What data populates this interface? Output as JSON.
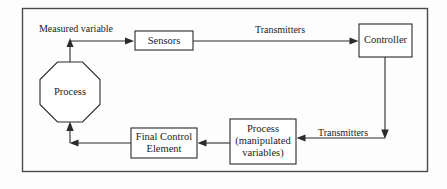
{
  "diagram": {
    "frame": {
      "present": true,
      "color": "#4a4a4a"
    },
    "background_color": "#fdfdfd",
    "line_color": "#2b2b2b",
    "nodes": [
      {
        "id": "sensors",
        "shape": "rectangle",
        "label_lines": [
          "Sensors"
        ],
        "x": 135,
        "y": 31,
        "w": 58,
        "h": 19
      },
      {
        "id": "controller",
        "shape": "rectangle",
        "label_lines": [
          "Controller"
        ],
        "x": 359,
        "y": 24,
        "w": 53,
        "h": 33
      },
      {
        "id": "process-octagon",
        "shape": "octagon",
        "label_lines": [
          "Process"
        ],
        "x": 40,
        "y": 62,
        "w": 60,
        "h": 60
      },
      {
        "id": "final-control-element",
        "shape": "rectangle",
        "label_lines": [
          "Final Control",
          "Element"
        ],
        "x": 131,
        "y": 128,
        "w": 66,
        "h": 30
      },
      {
        "id": "process-manipulated",
        "shape": "rectangle",
        "label_lines": [
          "Process",
          "(manipulated",
          "variables)"
        ],
        "x": 230,
        "y": 119,
        "w": 66,
        "h": 45
      }
    ],
    "edge_labels": [
      {
        "id": "measured-variable",
        "text": "Measured variable",
        "x": 76,
        "y": 30
      },
      {
        "id": "transmitters-top",
        "text": "Transmitters",
        "x": 280,
        "y": 31
      },
      {
        "id": "transmitters-bottom",
        "text": "Transmitters",
        "x": 343,
        "y": 134
      }
    ],
    "edges": [
      {
        "id": "process-to-sensors",
        "from": "process-octagon",
        "to": "sensors",
        "label": "Measured variable"
      },
      {
        "id": "sensors-to-controller",
        "from": "sensors",
        "to": "controller",
        "label": "Transmitters"
      },
      {
        "id": "controller-to-process-manipulated",
        "from": "controller",
        "to": "process-manipulated",
        "label": "Transmitters"
      },
      {
        "id": "process-manipulated-to-fce",
        "from": "process-manipulated",
        "to": "final-control-element",
        "label": ""
      },
      {
        "id": "fce-to-process-octagon",
        "from": "final-control-element",
        "to": "process-octagon",
        "label": ""
      }
    ]
  }
}
